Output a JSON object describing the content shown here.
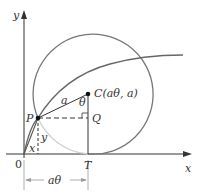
{
  "figure": {
    "labels": {
      "y_axis": "y",
      "x_axis": "x",
      "origin": "0",
      "point_P": "P",
      "point_T": "T",
      "point_Q": "Q",
      "center": "C(aθ, a)",
      "radius": "a",
      "angle": "θ",
      "x_coord": "x",
      "y_coord": "y",
      "arc_length": "aθ"
    },
    "colors": {
      "axis": "#333333",
      "circle": "#777777",
      "cycloid": "#666666",
      "cycloid_hidden": "#cfcfcf",
      "text": "#333333"
    }
  }
}
